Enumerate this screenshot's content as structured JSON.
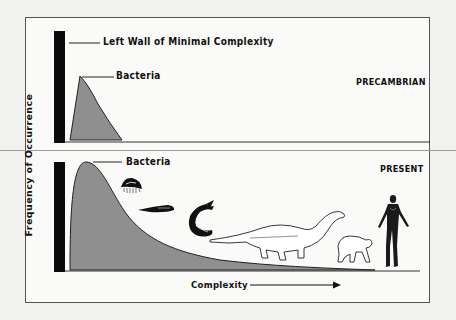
{
  "diagram": {
    "y_axis_label": "Frequency of Occurrence",
    "x_axis_label": "Complexity",
    "left_wall_label": "Left Wall of Minimal Complexity",
    "panels": [
      {
        "name": "precambrian",
        "title": "PRECAMBRIAN",
        "peak_label": "Bacteria",
        "organisms": []
      },
      {
        "name": "present",
        "title": "PRESENT",
        "peak_label": "Bacteria",
        "organisms": [
          "jellyfish",
          "trilobite-worm",
          "fish",
          "dinosaur",
          "ape",
          "human"
        ]
      }
    ],
    "colors": {
      "background": "#f2f2f0",
      "panel": "#fafaf8",
      "wall": "#0a0a0a",
      "curve_fill": "#8f8f8f",
      "line": "#222222"
    }
  }
}
